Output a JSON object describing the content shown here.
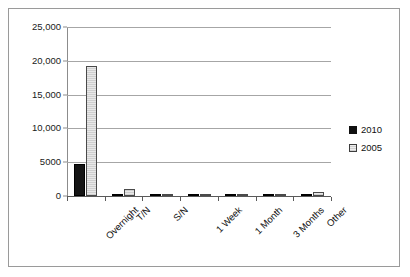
{
  "figure": {
    "border_color": "#9a9a9a",
    "background": "#ffffff"
  },
  "legend": {
    "position": "right",
    "entries": [
      {
        "label": "2010",
        "color": "#111111",
        "marker": "filled-square"
      },
      {
        "label": "2005",
        "color": "#d8d8d8",
        "marker": "hatched-square"
      }
    ]
  },
  "axis": {
    "y_ticks": [
      "0",
      "5000",
      "10,000",
      "15,000",
      "20,000",
      "25,000"
    ],
    "x_ticks": [
      "Overnight",
      "T/N",
      "S/N",
      "1 Week",
      "1 Month",
      "3 Months",
      "Other"
    ]
  },
  "chart_data": {
    "type": "bar",
    "title": "",
    "subtitle": "",
    "xlabel": "",
    "ylabel": "",
    "ylim": [
      0,
      25000
    ],
    "ytick_values": [
      0,
      5000,
      10000,
      15000,
      20000,
      25000
    ],
    "ytick_labels": [
      "0",
      "5000",
      "10,000",
      "15,000",
      "20,000",
      "25,000"
    ],
    "grid": true,
    "legend_position": "right",
    "categories": [
      "Overnight",
      "T/N",
      "S/N",
      "1 Week",
      "1 Month",
      "3 Months",
      "Other"
    ],
    "series": [
      {
        "name": "2010",
        "color": "#111111",
        "values": [
          4800,
          60,
          120,
          60,
          40,
          40,
          60
        ]
      },
      {
        "name": "2005",
        "color": "#d8d8d8",
        "values": [
          19300,
          1000,
          250,
          200,
          160,
          160,
          650
        ]
      }
    ]
  }
}
